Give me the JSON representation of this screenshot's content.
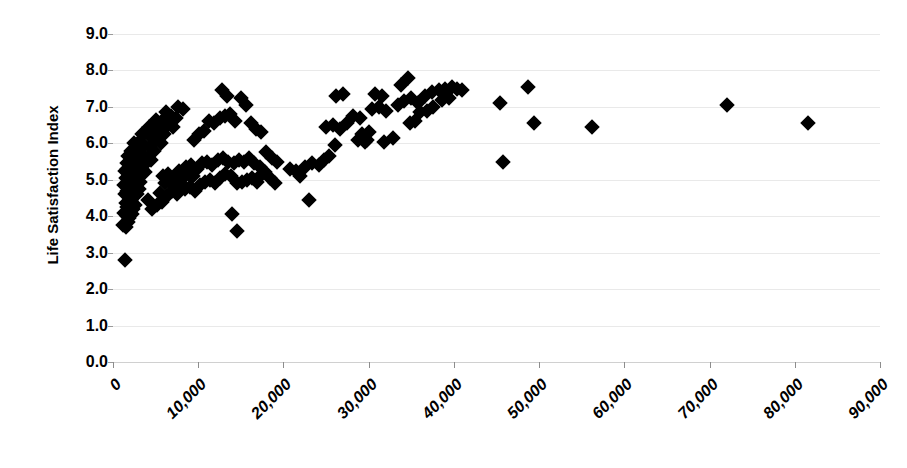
{
  "chart_data": {
    "type": "scatter",
    "title": "",
    "xlabel": "",
    "ylabel": "Life Satisfaction Index",
    "xlim": [
      0,
      90000
    ],
    "ylim": [
      0,
      9
    ],
    "grid": true,
    "legend": false,
    "marker_shape": "diamond",
    "marker_color": "#000000",
    "x_ticks": [
      0,
      10000,
      20000,
      30000,
      40000,
      50000,
      60000,
      70000,
      80000,
      90000
    ],
    "x_tick_labels": [
      "0",
      "10,000",
      "20,000",
      "30,000",
      "40,000",
      "50,000",
      "60,000",
      "70,000",
      "80,000",
      "90,000"
    ],
    "y_ticks": [
      0,
      1,
      2,
      3,
      4,
      5,
      6,
      7,
      8,
      9
    ],
    "y_tick_labels": [
      "0.0",
      "1.0",
      "2.0",
      "3.0",
      "4.0",
      "5.0",
      "6.0",
      "7.0",
      "8.0",
      "9.0"
    ],
    "points": [
      [
        1400,
        2.8
      ],
      [
        1200,
        3.75
      ],
      [
        1500,
        3.7
      ],
      [
        1750,
        3.85
      ],
      [
        1600,
        4.0
      ],
      [
        1900,
        3.95
      ],
      [
        1300,
        4.1
      ],
      [
        2000,
        4.15
      ],
      [
        1700,
        4.25
      ],
      [
        2200,
        4.05
      ],
      [
        2400,
        4.2
      ],
      [
        1500,
        4.35
      ],
      [
        1850,
        4.4
      ],
      [
        2100,
        4.45
      ],
      [
        2600,
        4.3
      ],
      [
        2300,
        4.55
      ],
      [
        1400,
        4.6
      ],
      [
        1650,
        4.7
      ],
      [
        2050,
        4.65
      ],
      [
        2500,
        4.75
      ],
      [
        2800,
        4.6
      ],
      [
        1250,
        4.85
      ],
      [
        1800,
        4.9
      ],
      [
        2250,
        4.95
      ],
      [
        2700,
        4.85
      ],
      [
        3000,
        4.75
      ],
      [
        1500,
        5.05
      ],
      [
        1900,
        5.1
      ],
      [
        2350,
        5.0
      ],
      [
        2900,
        5.05
      ],
      [
        3200,
        4.95
      ],
      [
        1350,
        5.25
      ],
      [
        1700,
        5.3
      ],
      [
        2150,
        5.2
      ],
      [
        2600,
        5.35
      ],
      [
        3100,
        5.15
      ],
      [
        1600,
        5.45
      ],
      [
        2000,
        5.5
      ],
      [
        2450,
        5.4
      ],
      [
        3400,
        5.3
      ],
      [
        3700,
        5.2
      ],
      [
        1800,
        5.65
      ],
      [
        2300,
        5.6
      ],
      [
        2800,
        5.55
      ],
      [
        3300,
        5.5
      ],
      [
        3900,
        5.45
      ],
      [
        2100,
        5.8
      ],
      [
        2700,
        5.85
      ],
      [
        3200,
        5.75
      ],
      [
        4100,
        5.6
      ],
      [
        4500,
        5.55
      ],
      [
        2500,
        6.0
      ],
      [
        3000,
        6.05
      ],
      [
        3600,
        5.95
      ],
      [
        4300,
        5.9
      ],
      [
        4800,
        5.8
      ],
      [
        3400,
        6.25
      ],
      [
        3800,
        6.3
      ],
      [
        4400,
        6.2
      ],
      [
        5100,
        6.1
      ],
      [
        5600,
        6.0
      ],
      [
        4200,
        6.45
      ],
      [
        4900,
        6.4
      ],
      [
        5400,
        6.35
      ],
      [
        6000,
        6.25
      ],
      [
        5000,
        6.65
      ],
      [
        5700,
        6.6
      ],
      [
        6400,
        6.5
      ],
      [
        7000,
        6.45
      ],
      [
        6200,
        6.85
      ],
      [
        6800,
        6.75
      ],
      [
        7400,
        6.7
      ],
      [
        7600,
        7.0
      ],
      [
        8200,
        6.95
      ],
      [
        4600,
        4.2
      ],
      [
        5200,
        4.3
      ],
      [
        4100,
        4.45
      ],
      [
        5800,
        4.4
      ],
      [
        5500,
        4.65
      ],
      [
        6300,
        4.55
      ],
      [
        6900,
        4.7
      ],
      [
        7500,
        4.6
      ],
      [
        6100,
        4.9
      ],
      [
        6700,
        4.95
      ],
      [
        7300,
        4.85
      ],
      [
        7900,
        4.9
      ],
      [
        5900,
        5.1
      ],
      [
        6500,
        5.15
      ],
      [
        7100,
        5.05
      ],
      [
        8000,
        5.0
      ],
      [
        7700,
        5.25
      ],
      [
        8300,
        5.2
      ],
      [
        8900,
        5.15
      ],
      [
        9400,
        5.1
      ],
      [
        8600,
        5.35
      ],
      [
        9200,
        5.4
      ],
      [
        9800,
        5.3
      ],
      [
        10400,
        5.45
      ],
      [
        11000,
        5.5
      ],
      [
        11600,
        5.4
      ],
      [
        8400,
        4.75
      ],
      [
        9000,
        4.8
      ],
      [
        9600,
        4.7
      ],
      [
        10200,
        4.85
      ],
      [
        10800,
        4.95
      ],
      [
        11400,
        5.0
      ],
      [
        12000,
        4.9
      ],
      [
        12600,
        5.05
      ],
      [
        13200,
        5.15
      ],
      [
        13800,
        5.1
      ],
      [
        12300,
        5.55
      ],
      [
        12900,
        5.6
      ],
      [
        13500,
        5.5
      ],
      [
        14200,
        5.45
      ],
      [
        14800,
        5.55
      ],
      [
        15400,
        5.5
      ],
      [
        16000,
        5.6
      ],
      [
        16600,
        5.45
      ],
      [
        17200,
        5.35
      ],
      [
        17800,
        5.2
      ],
      [
        18400,
        5.05
      ],
      [
        19000,
        4.9
      ],
      [
        14500,
        4.9
      ],
      [
        15100,
        4.95
      ],
      [
        15700,
        5.0
      ],
      [
        16300,
        5.05
      ],
      [
        16900,
        4.95
      ],
      [
        17500,
        5.15
      ],
      [
        9500,
        6.1
      ],
      [
        10100,
        6.25
      ],
      [
        10700,
        6.35
      ],
      [
        11300,
        6.6
      ],
      [
        11900,
        6.55
      ],
      [
        12500,
        6.7
      ],
      [
        13100,
        6.75
      ],
      [
        13700,
        6.8
      ],
      [
        14300,
        6.6
      ],
      [
        12800,
        7.45
      ],
      [
        13400,
        7.3
      ],
      [
        15000,
        7.25
      ],
      [
        15600,
        7.05
      ],
      [
        16200,
        6.55
      ],
      [
        16800,
        6.4
      ],
      [
        17400,
        6.3
      ],
      [
        18000,
        5.75
      ],
      [
        18600,
        5.6
      ],
      [
        19200,
        5.5
      ],
      [
        14000,
        4.05
      ],
      [
        14600,
        3.6
      ],
      [
        23000,
        4.45
      ],
      [
        22500,
        5.35
      ],
      [
        23400,
        5.45
      ],
      [
        24200,
        5.4
      ],
      [
        24800,
        5.55
      ],
      [
        25400,
        5.65
      ],
      [
        26000,
        5.95
      ],
      [
        21500,
        5.25
      ],
      [
        22000,
        5.1
      ],
      [
        20800,
        5.3
      ],
      [
        25000,
        6.45
      ],
      [
        25800,
        6.5
      ],
      [
        26600,
        6.4
      ],
      [
        27400,
        6.55
      ],
      [
        28200,
        6.75
      ],
      [
        29000,
        6.7
      ],
      [
        26200,
        7.3
      ],
      [
        27000,
        7.35
      ],
      [
        28800,
        6.1
      ],
      [
        29600,
        6.05
      ],
      [
        30400,
        6.95
      ],
      [
        31200,
        7.0
      ],
      [
        32000,
        6.9
      ],
      [
        30800,
        7.35
      ],
      [
        31600,
        7.3
      ],
      [
        29200,
        6.25
      ],
      [
        30000,
        6.3
      ],
      [
        32800,
        6.15
      ],
      [
        33400,
        7.05
      ],
      [
        34200,
        7.15
      ],
      [
        35000,
        7.25
      ],
      [
        33800,
        7.6
      ],
      [
        34600,
        7.8
      ],
      [
        35800,
        7.1
      ],
      [
        36600,
        7.3
      ],
      [
        37400,
        7.4
      ],
      [
        36000,
        6.85
      ],
      [
        36800,
        6.9
      ],
      [
        37600,
        7.0
      ],
      [
        35400,
        6.6
      ],
      [
        34800,
        6.55
      ],
      [
        38200,
        7.45
      ],
      [
        39000,
        7.5
      ],
      [
        39800,
        7.55
      ],
      [
        38600,
        7.2
      ],
      [
        39400,
        7.25
      ],
      [
        40400,
        7.5
      ],
      [
        41000,
        7.45
      ],
      [
        29800,
        6.1
      ],
      [
        31800,
        6.05
      ],
      [
        45400,
        7.1
      ],
      [
        48700,
        7.55
      ],
      [
        49400,
        6.55
      ],
      [
        56200,
        6.45
      ],
      [
        45800,
        5.5
      ],
      [
        72000,
        7.05
      ],
      [
        81500,
        6.55
      ]
    ]
  }
}
